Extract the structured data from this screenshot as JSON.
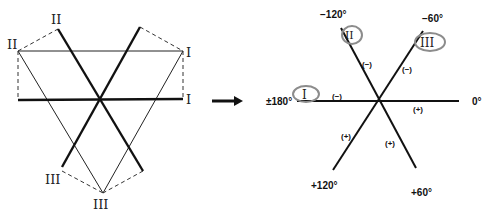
{
  "left_diagram": {
    "description": "Einthoven triangle with limb leads transposed to central point",
    "labels": {
      "lead_I_top": "I",
      "lead_I_bottom": "I",
      "lead_II_top_left": "II",
      "lead_II_top": "II",
      "lead_III_bottom_left": "III",
      "lead_III_bottom": "III"
    }
  },
  "arrow": {
    "direction": "right"
  },
  "right_diagram": {
    "description": "Hexaxial reference system (bipolar limb leads)",
    "angle_labels": {
      "minus_120": "−120°",
      "minus_60": "−60°",
      "plus_minus_180": "±180°",
      "zero": "0°",
      "plus_120": "+120°",
      "plus_60": "+60°"
    },
    "lead_labels": {
      "lead_I": "I",
      "lead_II": "II",
      "lead_III": "III"
    },
    "polarity_labels": {
      "lead_II_negative": "(−)",
      "lead_III_negative": "(−)",
      "lead_I_negative": "(−)",
      "lead_I_positive": "(+)",
      "lead_III_positive": "(+)",
      "lead_II_positive": "(+)"
    },
    "circle_color": "#8c8c8c",
    "line_color": "#111111"
  }
}
